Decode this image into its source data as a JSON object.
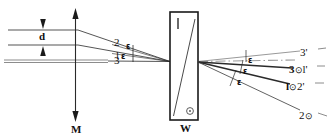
{
  "figure": {
    "type": "optical-ray-diagram",
    "background": "#ffffff",
    "line_color": "#1a1a1a",
    "gray_color": "#8c8c8c"
  },
  "left": {
    "rays": [
      {
        "id": "ray-2",
        "label": "2"
      },
      {
        "id": "ray-1",
        "label": "l"
      },
      {
        "id": "ray-3",
        "label": "3"
      }
    ],
    "separation_label": "d",
    "axis_label": "M",
    "angles": [
      {
        "id": "eps-left-upper",
        "label": "ε"
      },
      {
        "id": "eps-left-lower",
        "label": "ε"
      }
    ]
  },
  "slab": {
    "label": "W",
    "top_mark": "l",
    "bottom_mark": "⊙"
  },
  "right": {
    "angles": [
      {
        "id": "eps-right-1",
        "label": "ε"
      },
      {
        "id": "eps-right-2",
        "label": "ε"
      },
      {
        "id": "eps-right-3",
        "label": "ε"
      }
    ],
    "rays": [
      {
        "id": "out-ray-3p",
        "label": "3",
        "prime": "'",
        "dot": ""
      },
      {
        "id": "out-ray-3-1p",
        "label": "3",
        "prime": "",
        "dot": "⊙",
        "second": "l",
        "second_prime": "'"
      },
      {
        "id": "out-ray-1-2p",
        "label": "l",
        "prime": "",
        "dot": "⊙",
        "second": "2",
        "second_prime": "'"
      },
      {
        "id": "out-ray-2",
        "label": "2",
        "prime": "",
        "dot": "⊙"
      }
    ]
  }
}
